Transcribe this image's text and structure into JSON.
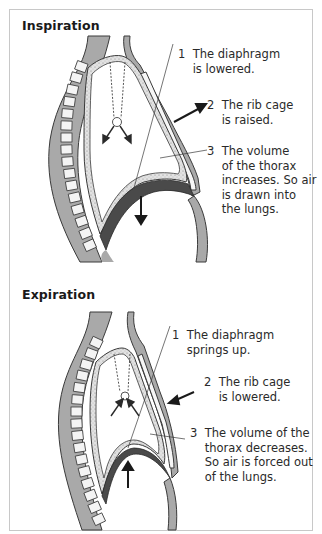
{
  "figure": {
    "panels": [
      {
        "title": "Inspiration",
        "labels": [
          {
            "number": "1",
            "text": "The diaphragm\nis lowered."
          },
          {
            "number": "2",
            "text": "The rib cage\nis raised."
          },
          {
            "number": "3",
            "text": "The volume\nof the thorax\nincreases. So air\nis drawn into\nthe lungs."
          }
        ],
        "arrows": [
          "rib-cage-outward-arrow",
          "diaphragm-down-arrow",
          "lung-expansion-arrows"
        ]
      },
      {
        "title": "Expiration",
        "labels": [
          {
            "number": "1",
            "text": "The diaphragm\nsprings up."
          },
          {
            "number": "2",
            "text": "The rib cage\nis lowered."
          },
          {
            "number": "3",
            "text": "The volume of the\nthorax decreases.\nSo air is forced out\nof the lungs."
          }
        ],
        "arrows": [
          "rib-cage-inward-arrow",
          "diaphragm-up-arrow",
          "lung-contraction-arrows"
        ]
      }
    ],
    "colors": {
      "body_tissue": "#a9a9a9",
      "rib_cage": "#bdbdbd",
      "diaphragm": "#4a4a4a",
      "pleura_stipple": "#d8d8d8",
      "outline": "#3a3a3a",
      "arrow": "#1a1a1a",
      "frame_border": "#c8c8c8"
    }
  }
}
